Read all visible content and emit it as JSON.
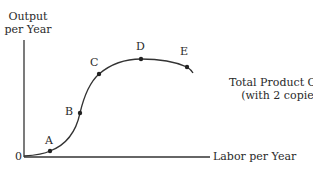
{
  "diagram": {
    "y_axis_label_line1": "Output",
    "y_axis_label_line2": "per Year",
    "x_axis_label": "Labor per Year",
    "origin_label": "0",
    "curve_label_line1": "Total Product Curve",
    "curve_label_line2": "(with 2 copiers)",
    "points": [
      {
        "label": "A"
      },
      {
        "label": "B"
      },
      {
        "label": "C"
      },
      {
        "label": "D"
      },
      {
        "label": "E"
      }
    ]
  }
}
